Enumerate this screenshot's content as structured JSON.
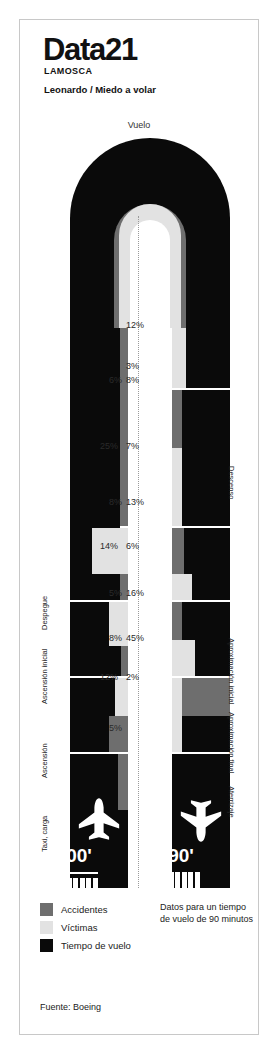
{
  "header": {
    "brand": "Data21",
    "brand_sub": "LAMOSCA",
    "subtitle": "Leonardo / Miedo a volar"
  },
  "chart_top_label": "Vuelo",
  "colors": {
    "accidentes": "#6e6e6e",
    "victimas": "#e2e2e2",
    "tiempo_vuelo": "#0a0a0a",
    "background": "#ffffff",
    "frame_border": "#c8c8c8",
    "dotted_line": "#9a9a9a"
  },
  "legend": {
    "items": [
      {
        "label": "Accidentes",
        "color": "#6e6e6e"
      },
      {
        "label": "Víctimas",
        "color": "#e2e2e2"
      },
      {
        "label": "Tiempo de vuelo",
        "color": "#0a0a0a"
      }
    ]
  },
  "note": "Datos para un tiempo de vuelo de 90 minutos",
  "source": "Fuente: Boeing",
  "planes": {
    "left": {
      "time_label": "00'",
      "icon": "airplane-takeoff-icon"
    },
    "right": {
      "time_label": "90'",
      "icon": "airplane-landing-icon"
    }
  },
  "chart_data": {
    "type": "bar",
    "title": "Leonardo / Miedo a volar",
    "subtitle": "Vuelo",
    "note": "Datos para un tiempo de vuelo de 90 minutos",
    "source": "Fuente: Boeing",
    "units": "percent",
    "series_names": [
      "Accidentes",
      "Víctimas",
      "Tiempo de vuelo"
    ],
    "left_column_label": "Ascenso (despegue → crucero)",
    "right_column_label": "Descenso (crucero → aterrizaje)",
    "phases_left": [
      {
        "label": "Taxi, carga",
        "victimas": null,
        "accidentes": 5
      },
      {
        "label": "Ascensión",
        "victimas": 8,
        "accidentes": 12
      },
      {
        "label": "Ascensión inicial",
        "victimas": 14,
        "accidentes": 5
      },
      {
        "label": "Despegue",
        "victimas": 25,
        "accidentes": 8
      },
      {
        "label": "Vuelo (crucero)",
        "victimas": 6,
        "accidentes": null
      }
    ],
    "phases_right": [
      {
        "label": "Descenso",
        "victimas": 12,
        "accidentes": 3,
        "extra": 8
      },
      {
        "label": "Aproximación inicial",
        "victimas": 7,
        "accidentes": 13
      },
      {
        "label": "Aproximación final",
        "victimas": 6,
        "accidentes": 16
      },
      {
        "label": "Aterrizaje",
        "victimas": 45,
        "accidentes": 2
      }
    ],
    "labels_left": [
      "6%",
      "25%",
      "8%",
      "14%",
      "5%",
      "8%",
      "12%",
      "5%"
    ],
    "labels_right": [
      "12%",
      "3%",
      "8%",
      "7%",
      "13%",
      "6%",
      "16%",
      "45%",
      "2%"
    ]
  },
  "side_labels": {
    "left": [
      "Despegue",
      "Ascensión inicial",
      "Ascensión",
      "Taxi, carga"
    ],
    "right": [
      "Descenso",
      "Aproximación inicial",
      "Aproximación final",
      "Aterrizaje"
    ]
  },
  "pct_labels_left": [
    {
      "text": "6%",
      "x": 96,
      "y": 375
    },
    {
      "text": "25%",
      "x": 92,
      "y": 441
    },
    {
      "text": "8%",
      "x": 96,
      "y": 497
    },
    {
      "text": "14%",
      "x": 92,
      "y": 541
    },
    {
      "text": "5%",
      "x": 96,
      "y": 588
    },
    {
      "text": "8%",
      "x": 96,
      "y": 633
    },
    {
      "text": "12%",
      "x": 92,
      "y": 672
    },
    {
      "text": "5%",
      "x": 96,
      "y": 723
    }
  ],
  "pct_labels_right": [
    {
      "text": "12%",
      "x": 126,
      "y": 320
    },
    {
      "text": "3%",
      "x": 126,
      "y": 361
    },
    {
      "text": "8%",
      "x": 126,
      "y": 375
    },
    {
      "text": "7%",
      "x": 126,
      "y": 441
    },
    {
      "text": "13%",
      "x": 126,
      "y": 497
    },
    {
      "text": "6%",
      "x": 126,
      "y": 541
    },
    {
      "text": "16%",
      "x": 126,
      "y": 588
    },
    {
      "text": "45%",
      "x": 126,
      "y": 633
    },
    {
      "text": "2%",
      "x": 126,
      "y": 672
    }
  ]
}
